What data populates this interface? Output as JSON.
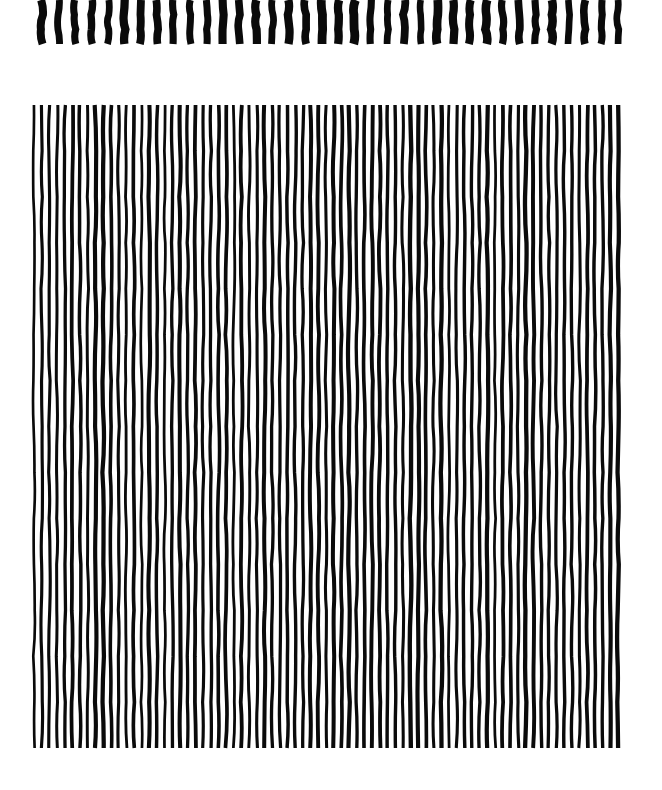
{
  "artwork": {
    "description": "Hand-drawn vertical line pattern",
    "ink_color": "#0a0a0a",
    "background_color": "#ffffff",
    "top_band": {
      "stroke_count": 36,
      "style": "thick short strokes"
    },
    "main_block": {
      "line_count": 77,
      "style": "thin wavy long lines"
    }
  }
}
